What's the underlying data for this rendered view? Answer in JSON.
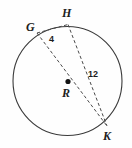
{
  "figure": {
    "kind": "circle-geometry-diagram",
    "background_color": "#fefefe",
    "stroke_color": "#3a3a3a",
    "dash_color": "#4a4a4a",
    "label_color": "#1d1d1d",
    "circle": {
      "name": "circle-R",
      "center_label": "R",
      "center_x": 67.5,
      "center_y": 81,
      "radius": 54.5
    },
    "points": [
      {
        "label": "G",
        "x": 37,
        "y": 33
      },
      {
        "label": "H",
        "x": 68,
        "y": 24.5
      },
      {
        "label": "K",
        "x": 107,
        "y": 126
      },
      {
        "label": "R",
        "x": 67.5,
        "y": 81
      }
    ],
    "segments": [
      {
        "name": "chord-GH",
        "from": "G",
        "to": "H",
        "style": "dashed",
        "measure": "4"
      },
      {
        "name": "chord-HK",
        "from": "H",
        "to": "K",
        "style": "dashed",
        "measure": "12"
      },
      {
        "name": "diameter-GK",
        "from": "G",
        "to": "K",
        "style": "dashed",
        "through": "R",
        "measure": ""
      }
    ],
    "labels": {
      "point_g": "G",
      "point_h": "H",
      "point_k": "K",
      "center_r": "R",
      "length_gh": "4",
      "length_hk": "12"
    }
  }
}
